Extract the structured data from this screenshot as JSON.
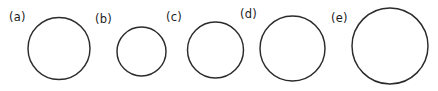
{
  "figure": {
    "background_color": "#ffffff",
    "stroke_color": "#2b2b2b",
    "label_color": "#1c1c1c",
    "stroke_width": 1.45,
    "width": 438,
    "height": 91
  },
  "chart_data": {
    "type": "diagram",
    "title": "",
    "subtitle": "",
    "xlabel": "",
    "ylabel": "",
    "grid": false,
    "legend": "none",
    "shape": "circle",
    "units": "pixels",
    "categories": [
      "(a)",
      "(b)",
      "(c)",
      "(d)",
      "(e)"
    ],
    "values": [
      62,
      49,
      56,
      65,
      76
    ],
    "series": [
      {
        "name": "diameter",
        "values": [
          62,
          49,
          56,
          65,
          76
        ]
      },
      {
        "name": "radius",
        "values": [
          31,
          24.5,
          28,
          32.5,
          38
        ]
      }
    ],
    "items": [
      {
        "label": "(a)",
        "cx": 59,
        "cy": 48.5,
        "r": 31,
        "diameter": 62,
        "label_x": 9,
        "label_y": 12
      },
      {
        "label": "(b)",
        "cx": 141.5,
        "cy": 51.5,
        "r": 24.5,
        "diameter": 49,
        "label_x": 95,
        "label_y": 14
      },
      {
        "label": "(c)",
        "cx": 215.5,
        "cy": 50,
        "r": 28,
        "diameter": 56,
        "label_x": 166,
        "label_y": 12
      },
      {
        "label": "(d)",
        "cx": 292.5,
        "cy": 48.5,
        "r": 32.5,
        "diameter": 65,
        "label_x": 240,
        "label_y": 9
      },
      {
        "label": "(e)",
        "cx": 390,
        "cy": 46,
        "r": 38,
        "diameter": 76,
        "label_x": 331,
        "label_y": 13
      }
    ]
  }
}
